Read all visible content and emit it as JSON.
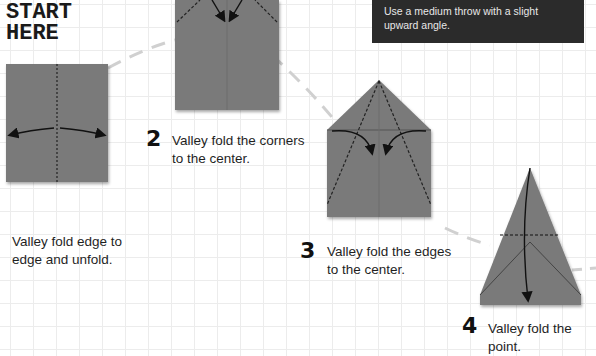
{
  "header": {
    "start_line1": "START",
    "start_line2": "HERE"
  },
  "tip": {
    "line1": "Use a medium throw with a slight",
    "line2": "upward angle."
  },
  "steps": [
    {
      "number": "",
      "line1": "Valley fold edge to",
      "line2": "edge and unfold."
    },
    {
      "number": "2",
      "line1": "Valley fold the corners",
      "line2": "to the center."
    },
    {
      "number": "3",
      "line1": "Valley fold the edges",
      "line2": "to the center."
    },
    {
      "number": "4",
      "line1": "Valley fold the point.",
      "line2": ""
    }
  ],
  "colors": {
    "paper": "#7a7a7a",
    "tip_bg": "#2b2b2b",
    "grid": "#ececec",
    "dash_path": "#cfcfcf"
  }
}
